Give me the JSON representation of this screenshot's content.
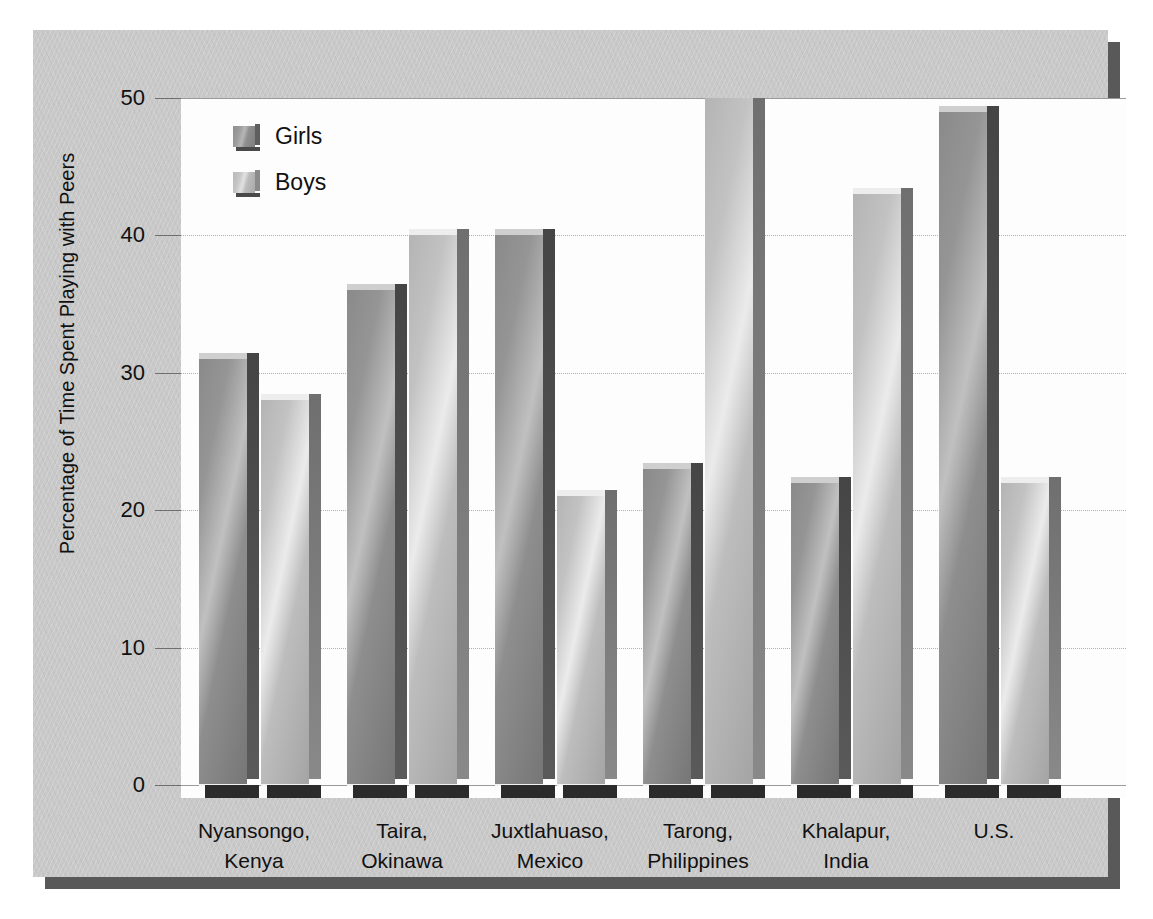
{
  "chart_data": {
    "type": "bar",
    "title": "",
    "xlabel": "",
    "ylabel": "Percentage of Time Spent Playing with Peers",
    "ylim": [
      0,
      50
    ],
    "yticks": [
      0,
      10,
      20,
      30,
      40,
      50
    ],
    "grid": true,
    "legend_position": "top-left",
    "categories": [
      "Nyansongo,\nKenya",
      "Taira,\nOkinawa",
      "Juxtlahuaso,\nMexico",
      "Tarong,\nPhilippines",
      "Khalapur,\nIndia",
      "U.S."
    ],
    "category_lines": [
      [
        "Nyansongo,",
        "Kenya"
      ],
      [
        "Taira,",
        "Okinawa"
      ],
      [
        "Juxtlahuaso,",
        "Mexico"
      ],
      [
        "Tarong,",
        "Philippines"
      ],
      [
        "Khalapur,",
        "India"
      ],
      [
        "U.S.",
        ""
      ]
    ],
    "series": [
      {
        "name": "Girls",
        "color": "#8e8e8e",
        "values": [
          31,
          36,
          40,
          23,
          22,
          49
        ]
      },
      {
        "name": "Boys",
        "color": "#c4c4c4",
        "values": [
          28,
          40,
          21,
          50,
          43,
          22
        ]
      }
    ]
  },
  "axis": {
    "ticks": [
      {
        "value": 50,
        "label": "50"
      },
      {
        "value": 40,
        "label": "40"
      },
      {
        "value": 30,
        "label": "30"
      },
      {
        "value": 20,
        "label": "20"
      },
      {
        "value": 10,
        "label": "10"
      },
      {
        "value": 0,
        "label": "0"
      }
    ],
    "y_title": "Percentage of Time Spent Playing with Peers"
  },
  "legend": {
    "items": [
      {
        "label": "Girls",
        "key": "girls"
      },
      {
        "label": "Boys",
        "key": "boys"
      }
    ]
  },
  "colors": {
    "panel": "#c9c9c9",
    "shadow": "#595959",
    "plot_background": "#fdfdfd",
    "gridline": "#9a9a9a",
    "girls": "#8e8e8e",
    "boys": "#c4c4c4",
    "bar_base": "#2b2b2b",
    "text": "#111111"
  }
}
